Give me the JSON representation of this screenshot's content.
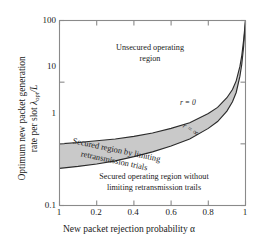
{
  "chart_data": {
    "type": "area",
    "title": "",
    "xlabel": "New packet rejection probability α",
    "ylabel": "Optimum new packet generation rate per slot λ_opt/L",
    "xlim": [
      0,
      1
    ],
    "ylim": [
      0.1,
      100
    ],
    "yscale": "log",
    "xscale": "linear",
    "grid": false,
    "legend_position": "inline-annotations",
    "xticks": [
      "1",
      "0.2",
      "0.4",
      "0.6",
      "0.8",
      "1"
    ],
    "xtick_values": [
      0.0,
      0.2,
      0.4,
      0.6,
      0.8,
      1.0
    ],
    "yticks": [
      "100",
      "10",
      "1",
      "0.1"
    ],
    "ytick_values": [
      100,
      10,
      1,
      0.1
    ],
    "series": [
      {
        "name": "r = 0",
        "x": [
          0.0,
          0.1,
          0.2,
          0.3,
          0.4,
          0.5,
          0.6,
          0.7,
          0.8,
          0.85,
          0.9,
          0.93,
          0.95,
          0.97,
          0.98,
          0.99,
          1.0
        ],
        "values": [
          1.0,
          1.05,
          1.12,
          1.2,
          1.32,
          1.5,
          1.78,
          2.2,
          3.1,
          3.9,
          5.6,
          7.6,
          10.5,
          18.0,
          27.0,
          48.0,
          100.0
        ]
      },
      {
        "name": "r = ∞",
        "x": [
          0.0,
          0.1,
          0.2,
          0.3,
          0.4,
          0.5,
          0.6,
          0.7,
          0.8,
          0.85,
          0.9,
          0.93,
          0.95,
          0.97,
          0.98,
          0.99,
          1.0
        ],
        "values": [
          0.4,
          0.43,
          0.47,
          0.53,
          0.62,
          0.74,
          0.92,
          1.2,
          1.78,
          2.3,
          3.4,
          4.8,
          6.8,
          12.5,
          19.5,
          38.0,
          100.0
        ]
      }
    ],
    "shaded_band": {
      "label": "Secured region by limiting retransmission trials",
      "between": [
        "r = ∞",
        "r = 0"
      ],
      "fill_color": "#c9c9c9"
    },
    "annotations": [
      {
        "id": "unsecured",
        "text": "Unsecured operating region",
        "x": 0.42,
        "y": 22
      },
      {
        "id": "band",
        "text": "Secured region by limiting retransmission trials",
        "x": 0.35,
        "y": 1.0
      },
      {
        "id": "secured-without",
        "text": "Secured operating region without limiting retransmission trails",
        "x": 0.52,
        "y": 0.3
      },
      {
        "id": "r-zero",
        "text": "r = 0",
        "x": 0.78,
        "y": 3.4
      },
      {
        "id": "r-infinity",
        "text": "r = ∞",
        "x": 0.85,
        "y": 1.75
      }
    ]
  },
  "axes": {
    "y_label_line1": "Optimum new packet generation",
    "y_label_line2_pre": "rate per slot ",
    "y_label_lambda": "λ",
    "y_label_sub": "opt",
    "y_label_post": "/L",
    "x_label": "New packet rejection probability α",
    "yticks": [
      "100",
      "10",
      "1",
      "0.1"
    ],
    "xticks": [
      "1",
      "0.2",
      "0.4",
      "0.6",
      "0.8",
      "1"
    ]
  },
  "annotations": {
    "unsecured_line1": "Unsecured operating",
    "unsecured_line2": "region",
    "band_line1": "Secured region by limiting",
    "band_line2": "retransmission trials",
    "secured_line1": "Secured operating region without",
    "secured_line2": "limiting retransmission trails",
    "r_zero": "r = 0",
    "r_infinity": "r = ∞"
  },
  "colors": {
    "band_fill": "#c9c9c9",
    "curve": "#2b2b2b",
    "frame": "#8a8a8a",
    "text": "#1a1a1a",
    "background": "#ffffff"
  }
}
